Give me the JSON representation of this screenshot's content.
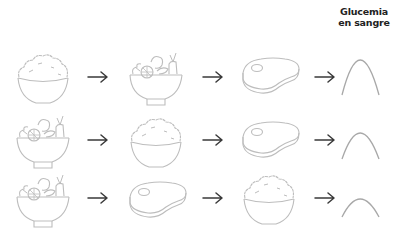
{
  "header": {
    "title_line1": "Glucemia",
    "title_line2": "en sangre"
  },
  "colors": {
    "icon_stroke": "#b8b8b8",
    "arrow": "#3a3a3a",
    "curve": "#a8a8a8",
    "text": "#222222"
  },
  "rows": [
    {
      "sequence": [
        "rice-bowl",
        "salad-bowl",
        "steak"
      ],
      "glucose_response": "high"
    },
    {
      "sequence": [
        "salad-bowl",
        "rice-bowl",
        "steak"
      ],
      "glucose_response": "medium"
    },
    {
      "sequence": [
        "salad-bowl",
        "steak",
        "rice-bowl"
      ],
      "glucose_response": "low"
    }
  ]
}
